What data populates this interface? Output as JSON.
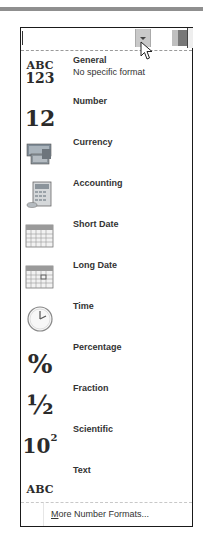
{
  "combo": {
    "value": "",
    "dropdown_icon": "chevron-down-icon"
  },
  "items": [
    {
      "id": "general",
      "label": "General",
      "sublabel": "No specific format",
      "icon": "ABC 123"
    },
    {
      "id": "number",
      "label": "Number",
      "icon": "12"
    },
    {
      "id": "currency",
      "label": "Currency",
      "icon": "currency-icon"
    },
    {
      "id": "accounting",
      "label": "Accounting",
      "icon": "accounting-icon"
    },
    {
      "id": "short-date",
      "label": "Short Date",
      "icon": "calendar-icon"
    },
    {
      "id": "long-date",
      "label": "Long Date",
      "icon": "calendar-icon"
    },
    {
      "id": "time",
      "label": "Time",
      "icon": "clock-icon"
    },
    {
      "id": "percentage",
      "label": "Percentage",
      "icon": "%"
    },
    {
      "id": "fraction",
      "label": "Fraction",
      "icon": "½"
    },
    {
      "id": "scientific",
      "label": "Scientific",
      "icon": "10²"
    },
    {
      "id": "text",
      "label": "Text",
      "icon": "ABC"
    }
  ],
  "icon_text": {
    "general_top": "ABC",
    "general_bottom": "123",
    "number": "12",
    "percentage": "%",
    "fraction": "½",
    "scientific_base": "10",
    "scientific_exp": "2",
    "text": "ABC"
  },
  "more": {
    "accesskey": "M",
    "rest": "ore Number Formats..."
  }
}
